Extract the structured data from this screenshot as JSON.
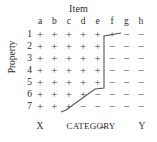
{
  "figure": {
    "title_top": "Item",
    "title_left": "Property",
    "colors": {
      "text": "#2a2a2a",
      "symbol": "#3a3a3a",
      "boundary_line": "#555555",
      "background": "#ffffff"
    }
  },
  "columns": [
    "a",
    "b",
    "c",
    "d",
    "e",
    "f",
    "g",
    "h"
  ],
  "rows": [
    "1",
    "2",
    "3",
    "4",
    "5",
    "6",
    "7"
  ],
  "symbols": {
    "present": "+",
    "absent": "−"
  },
  "matrix": [
    [
      "+",
      "+",
      "+",
      "+",
      "+",
      "+",
      "−",
      "−"
    ],
    [
      "+",
      "+",
      "+",
      "+",
      "+",
      "−",
      "−",
      "−"
    ],
    [
      "+",
      "+",
      "+",
      "+",
      "+",
      "−",
      "−",
      "−"
    ],
    [
      "+",
      "+",
      "+",
      "+",
      "+",
      "−",
      "−",
      "−"
    ],
    [
      "+",
      "+",
      "+",
      "+",
      "+",
      "−",
      "−",
      "−"
    ],
    [
      "+",
      "+",
      "+",
      "+",
      "−",
      "−",
      "−",
      "−"
    ],
    [
      "+",
      "+",
      "+",
      "−",
      "−",
      "−",
      "−",
      "−"
    ]
  ],
  "category_axis": {
    "left_endpoint": "X",
    "right_endpoint": "Y",
    "label": "CATEGORY",
    "arrow_left": "←",
    "arrow_right": "→"
  },
  "chart_data": {
    "type": "heatmap",
    "title": "Item",
    "xlabel": "Item",
    "ylabel": "Property",
    "x_tick_labels": [
      "a",
      "b",
      "c",
      "d",
      "e",
      "f",
      "g",
      "h"
    ],
    "y_tick_labels": [
      "1",
      "2",
      "3",
      "4",
      "5",
      "6",
      "7"
    ],
    "grid": false,
    "legend": "none",
    "values": [
      [
        1,
        1,
        1,
        1,
        1,
        1,
        0,
        0
      ],
      [
        1,
        1,
        1,
        1,
        1,
        0,
        0,
        0
      ],
      [
        1,
        1,
        1,
        1,
        1,
        0,
        0,
        0
      ],
      [
        1,
        1,
        1,
        1,
        1,
        0,
        0,
        0
      ],
      [
        1,
        1,
        1,
        1,
        1,
        0,
        0,
        0
      ],
      [
        1,
        1,
        1,
        1,
        0,
        0,
        0,
        0
      ],
      [
        1,
        1,
        1,
        0,
        0,
        0,
        0,
        0
      ]
    ],
    "annotations": [
      "Item",
      "Property",
      "X",
      "CATEGORY",
      "Y"
    ]
  }
}
